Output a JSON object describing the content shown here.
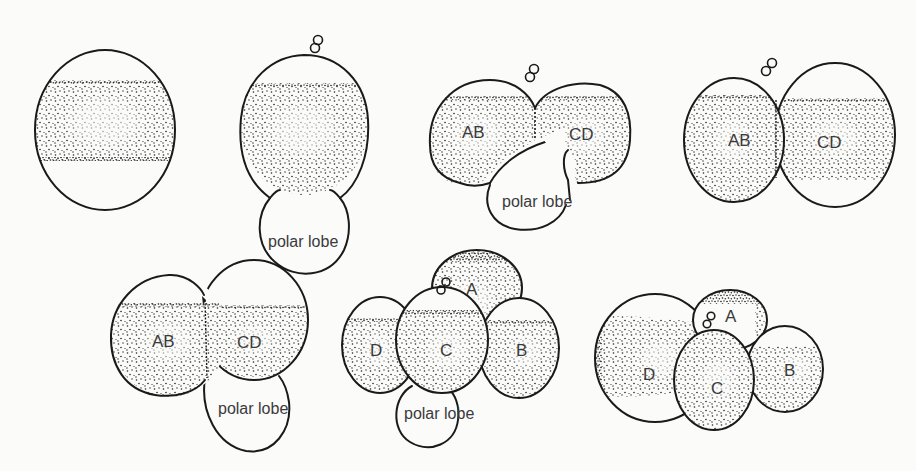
{
  "figure": {
    "type": "diagram",
    "colors": {
      "background": "#fbfbfa",
      "ink": "#1a1a1a",
      "label": "#3a3a3a"
    }
  },
  "stages": [
    {
      "id": 1,
      "row": 1,
      "labels": [],
      "has_polar_bodies": true
    },
    {
      "id": 2,
      "row": 1,
      "labels": [
        "polar lobe"
      ],
      "has_polar_bodies": true
    },
    {
      "id": 3,
      "row": 1,
      "labels": [
        "AB",
        "CD",
        "polar lobe"
      ],
      "has_polar_bodies": true
    },
    {
      "id": 4,
      "row": 1,
      "labels": [
        "AB",
        "CD"
      ],
      "has_polar_bodies": true
    },
    {
      "id": 5,
      "row": 2,
      "labels": [
        "AB",
        "CD",
        "polar lobe"
      ],
      "has_polar_bodies": false
    },
    {
      "id": 6,
      "row": 2,
      "labels": [
        "A",
        "B",
        "C",
        "D",
        "polar lobe"
      ],
      "has_polar_bodies": true
    },
    {
      "id": 7,
      "row": 2,
      "labels": [
        "A",
        "B",
        "C",
        "D"
      ],
      "has_polar_bodies": true
    }
  ],
  "labels": {
    "polar_lobe": "polar lobe",
    "AB": "AB",
    "CD": "CD",
    "A": "A",
    "B": "B",
    "C": "C",
    "D": "D"
  }
}
